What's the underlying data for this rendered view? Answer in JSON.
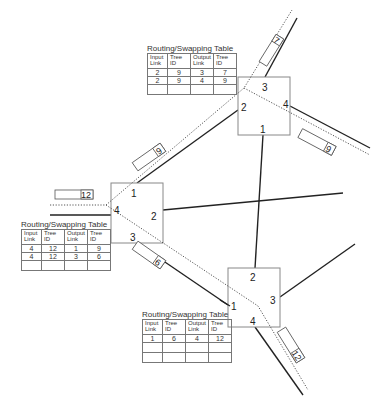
{
  "diagram": {
    "type": "network-routing-swapping",
    "nodes": [
      {
        "id": "top-right",
        "ports": [
          "1",
          "2",
          "3",
          "4"
        ]
      },
      {
        "id": "middle-left",
        "ports": [
          "1",
          "2",
          "3",
          "4"
        ]
      },
      {
        "id": "bottom",
        "ports": [
          "1",
          "2",
          "3",
          "4"
        ]
      }
    ],
    "packets": [
      {
        "label": "7"
      },
      {
        "label": "9"
      },
      {
        "label": "9"
      },
      {
        "label": "12"
      },
      {
        "label": "6"
      },
      {
        "label": "12"
      }
    ],
    "tables": [
      {
        "title": "Routing/Swapping Table",
        "headers": [
          "Input Link",
          "Tree ID",
          "Output Link",
          "Tree ID"
        ],
        "rows": [
          [
            "2",
            "9",
            "3",
            "7"
          ],
          [
            "2",
            "9",
            "4",
            "9"
          ],
          [
            "",
            "",
            "",
            ""
          ]
        ]
      },
      {
        "title": "Routing/Swapping Table",
        "headers": [
          "Input Link",
          "Tree ID",
          "Output Link",
          "Tree ID"
        ],
        "rows": [
          [
            "4",
            "12",
            "1",
            "9"
          ],
          [
            "4",
            "12",
            "3",
            "6"
          ],
          [
            "",
            "",
            "",
            ""
          ]
        ]
      },
      {
        "title": "Routing/Swapping Table",
        "headers": [
          "Input Link",
          "Tree ID",
          "Output Link",
          "Tree ID"
        ],
        "rows": [
          [
            "1",
            "6",
            "4",
            "12"
          ],
          [
            "",
            "",
            "",
            ""
          ],
          [
            "",
            "",
            "",
            ""
          ]
        ]
      }
    ]
  }
}
